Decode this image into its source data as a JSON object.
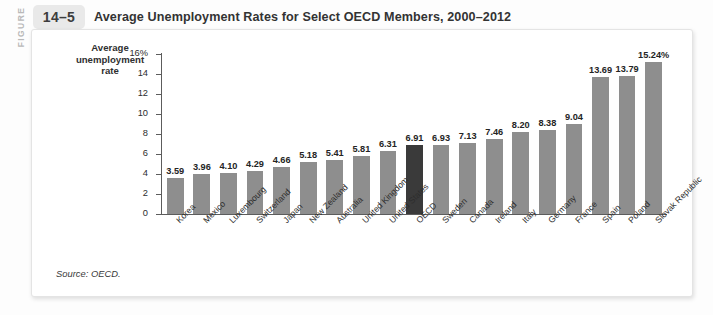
{
  "figure": {
    "label_word": "FIGURE",
    "number": "14–5",
    "title": "Average Unemployment Rates for Select OECD Members, 2000–2012",
    "source": "Source: OECD."
  },
  "chart_data": {
    "type": "bar",
    "title": "Average Unemployment Rates for Select OECD Members, 2000–2012",
    "xlabel": "",
    "ylabel": "Average unemployment rate",
    "ylim": [
      0,
      16
    ],
    "yticks": [
      "0",
      "2",
      "4",
      "6",
      "8",
      "10",
      "12",
      "14",
      "16%"
    ],
    "ytick_values": [
      0,
      2,
      4,
      6,
      8,
      10,
      12,
      14,
      16
    ],
    "grid": false,
    "legend": "none",
    "highlight_category": "OECD",
    "highlight_color": "#3a3a3a",
    "bar_color": "#8e8e8e",
    "categories": [
      "Korea",
      "Mexico",
      "Luxembourg",
      "Switzerland",
      "Japan",
      "New Zealand",
      "Australia",
      "United Kingdom",
      "United States",
      "OECD",
      "Sweden",
      "Canada",
      "Ireland",
      "Italy",
      "Germany",
      "France",
      "Spain",
      "Poland",
      "Slovak Republic"
    ],
    "values": [
      3.59,
      3.96,
      4.1,
      4.29,
      4.66,
      5.18,
      5.41,
      5.81,
      6.31,
      6.91,
      6.93,
      7.13,
      7.46,
      8.2,
      8.38,
      9.04,
      13.69,
      13.79,
      15.24
    ],
    "value_labels": [
      "3.59",
      "3.96",
      "4.10",
      "4.29",
      "4.66",
      "5.18",
      "5.41",
      "5.81",
      "6.31",
      "6.91",
      "6.93",
      "7.13",
      "7.46",
      "8.20",
      "8.38",
      "9.04",
      "13.69",
      "13.79",
      "15.24%"
    ]
  }
}
